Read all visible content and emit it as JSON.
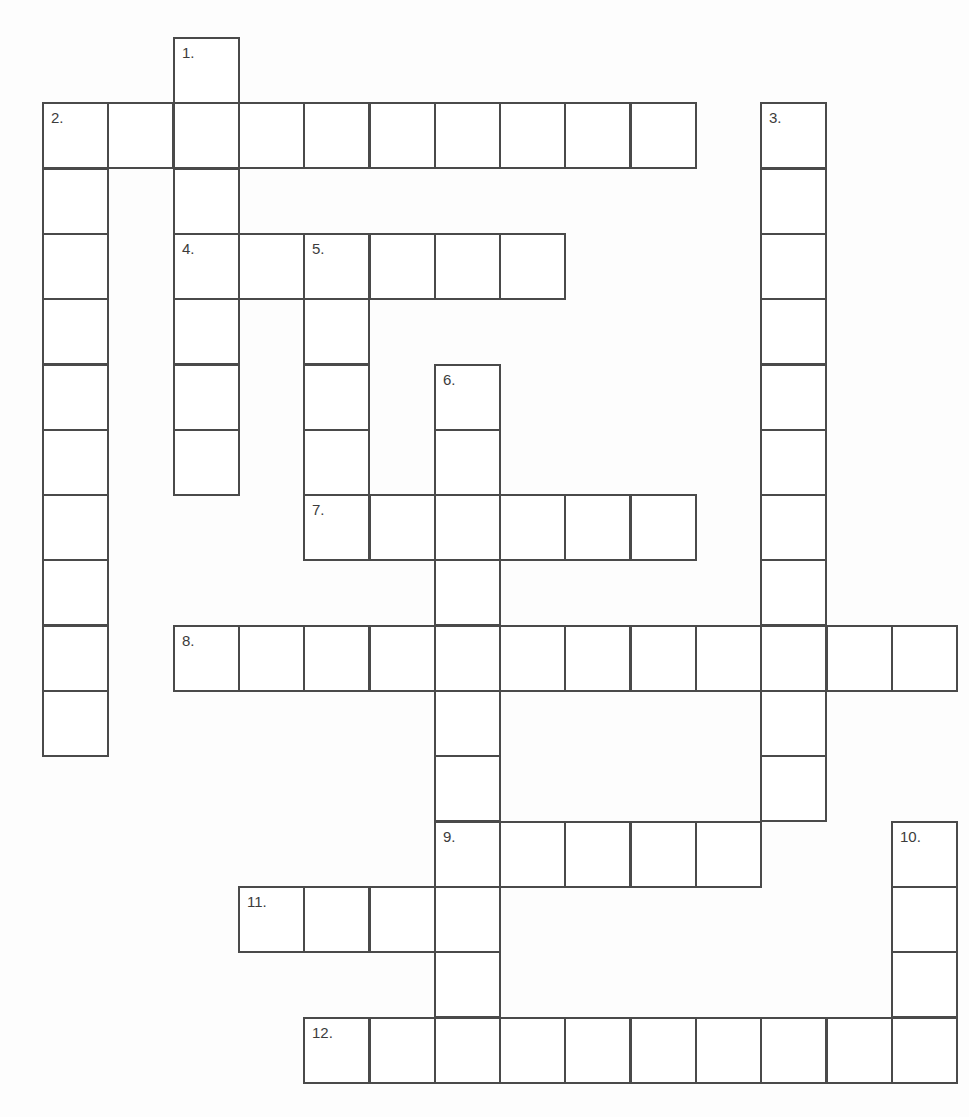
{
  "puzzle": {
    "title": "",
    "colors": {
      "line": "#4a4a4a",
      "background": "#ffffff",
      "number": "#3c3c3c"
    },
    "grid": {
      "origin_x": 42,
      "origin_y": 37,
      "cell_size": 65.3,
      "columns": 14,
      "rows": 16
    },
    "entries": [
      {
        "number": 1,
        "label": "1.",
        "direction": "down",
        "row": 0,
        "col": 2,
        "length": 7
      },
      {
        "number": 2,
        "label": "2.",
        "direction": "across",
        "row": 1,
        "col": 0,
        "length": 10
      },
      {
        "number": 2,
        "label": "2.",
        "direction": "down",
        "row": 1,
        "col": 0,
        "length": 10
      },
      {
        "number": 3,
        "label": "3.",
        "direction": "down",
        "row": 1,
        "col": 11,
        "length": 11
      },
      {
        "number": 4,
        "label": "4.",
        "direction": "across",
        "row": 3,
        "col": 2,
        "length": 6
      },
      {
        "number": 5,
        "label": "5.",
        "direction": "down",
        "row": 3,
        "col": 4,
        "length": 5
      },
      {
        "number": 6,
        "label": "6.",
        "direction": "down",
        "row": 5,
        "col": 6,
        "length": 10
      },
      {
        "number": 7,
        "label": "7.",
        "direction": "across",
        "row": 7,
        "col": 4,
        "length": 6
      },
      {
        "number": 8,
        "label": "8.",
        "direction": "across",
        "row": 9,
        "col": 2,
        "length": 12
      },
      {
        "number": 9,
        "label": "9.",
        "direction": "across",
        "row": 12,
        "col": 6,
        "length": 5
      },
      {
        "number": 10,
        "label": "10.",
        "direction": "down",
        "row": 12,
        "col": 13,
        "length": 4
      },
      {
        "number": 11,
        "label": "11.",
        "direction": "across",
        "row": 13,
        "col": 3,
        "length": 4
      },
      {
        "number": 12,
        "label": "12.",
        "direction": "across",
        "row": 15,
        "col": 4,
        "length": 10
      }
    ],
    "clue_numbers": [
      {
        "label": "1.",
        "row": 0,
        "col": 2
      },
      {
        "label": "2.",
        "row": 1,
        "col": 0
      },
      {
        "label": "3.",
        "row": 1,
        "col": 11
      },
      {
        "label": "4.",
        "row": 3,
        "col": 2
      },
      {
        "label": "5.",
        "row": 3,
        "col": 4
      },
      {
        "label": "6.",
        "row": 5,
        "col": 6
      },
      {
        "label": "7.",
        "row": 7,
        "col": 4
      },
      {
        "label": "8.",
        "row": 9,
        "col": 2
      },
      {
        "label": "9.",
        "row": 12,
        "col": 6
      },
      {
        "label": "10.",
        "row": 12,
        "col": 13
      },
      {
        "label": "11.",
        "row": 13,
        "col": 3
      },
      {
        "label": "12.",
        "row": 15,
        "col": 4
      }
    ]
  }
}
